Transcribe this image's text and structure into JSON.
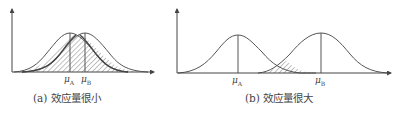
{
  "panels": [
    {
      "id": "a",
      "caption": "(a) 效应量很小",
      "mu_a_label": "μ",
      "mu_a_sub": "A",
      "mu_b_label": "μ",
      "mu_b_sub": "B",
      "description": "Two heavily overlapping normal curves; overlap region hatched"
    },
    {
      "id": "b",
      "caption": "(b) 效应量很大",
      "mu_a_label": "μ",
      "mu_a_sub": "A",
      "mu_b_label": "μ",
      "mu_b_sub": "B",
      "description": "Two well-separated normal curves; small hatched overlap in tails"
    }
  ],
  "colors": {
    "line": "#555555",
    "hatch": "#666666",
    "background": "#ffffff"
  }
}
